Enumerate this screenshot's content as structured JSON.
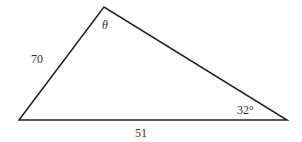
{
  "diagram": {
    "type": "triangle",
    "vertices": {
      "left": [
        19,
        120
      ],
      "top": [
        104,
        7
      ],
      "right": [
        287,
        120
      ]
    },
    "labels": {
      "left_side": "70",
      "bottom_side": "51",
      "top_angle": "θ",
      "right_angle": "32°"
    },
    "stroke_color": "#222222"
  }
}
